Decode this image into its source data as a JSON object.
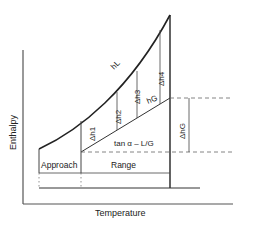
{
  "diagram": {
    "axes": {
      "y_label": "Enthalpy",
      "x_label": "Temperature"
    },
    "curves": {
      "saturation_curve_label": "hL",
      "operating_line_label": "hG",
      "slope_label": "tan α – L/G"
    },
    "deltas": [
      "Δh1",
      "Δh2",
      "Δh3",
      "Δh4"
    ],
    "delta_gas": "ΔhG",
    "regions": {
      "approach": "Approach",
      "range": "Range"
    },
    "colors": {
      "line": "#222222",
      "background": "#ffffff"
    }
  }
}
